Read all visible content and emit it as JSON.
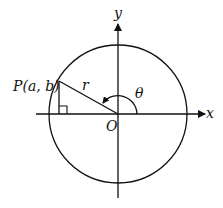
{
  "diagram": {
    "title": "",
    "labels": {
      "x_axis": "x",
      "y_axis": "y",
      "origin": "O",
      "point": "P(a, b)",
      "radius": "r",
      "angle": "θ"
    },
    "elements": {
      "circle": {
        "center": "O",
        "description": "circle of radius r centered at origin"
      },
      "point": {
        "name": "P",
        "coordinates": "(a, b)",
        "quadrant": "II"
      },
      "segments": [
        "OP (radius r)",
        "perpendicular from P to x-axis"
      ],
      "right_angle_marker": "at foot of perpendicular from P on x-axis",
      "angle_arc": "θ measured counterclockwise from positive x-axis to OP"
    },
    "colors": {
      "stroke": "#111111",
      "background": "#ffffff"
    }
  }
}
